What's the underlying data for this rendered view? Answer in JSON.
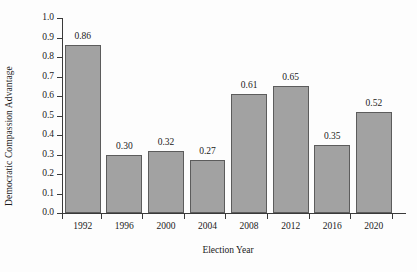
{
  "chart_data": {
    "type": "bar",
    "title": "",
    "xlabel": "Election Year",
    "ylabel": "Democratic Compassion Advantage",
    "categories": [
      "1992",
      "1996",
      "2000",
      "2004",
      "2008",
      "2012",
      "2016",
      "2020"
    ],
    "values": [
      0.86,
      0.3,
      0.32,
      0.27,
      0.61,
      0.65,
      0.35,
      0.52
    ],
    "value_labels": [
      "0.86",
      "0.30",
      "0.32",
      "0.27",
      "0.61",
      "0.65",
      "0.35",
      "0.52"
    ],
    "ylim": [
      0.0,
      1.0
    ],
    "ytick_labels": [
      "0.0",
      "0.1",
      "0.2",
      "0.3",
      "0.4",
      "0.5",
      "0.6",
      "0.7",
      "0.8",
      "0.9",
      "1.0"
    ],
    "ytick_values": [
      0.0,
      0.1,
      0.2,
      0.3,
      0.4,
      0.5,
      0.6,
      0.7,
      0.8,
      0.9,
      1.0
    ],
    "grid": false,
    "legend": null,
    "bar_color": "#a2a2a2",
    "bar_edge_color": "#5c5c5c",
    "axis_color": "#3a3a3a",
    "background_color": "#fdfdfd"
  }
}
